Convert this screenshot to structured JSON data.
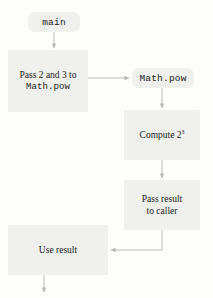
{
  "diagram": {
    "colors": {
      "node_fill": "#f0f0ee",
      "edge_stroke": "#b9b9b5",
      "text": "#1b1b1b",
      "background": "#fdfdfc"
    },
    "nodes": [
      {
        "id": "main",
        "shape": "rounded-pill",
        "label": "main",
        "font": "mono"
      },
      {
        "id": "pass-args",
        "shape": "rectangle",
        "label_line1": "Pass 2 and 3 to",
        "label_line2": "Math.pow",
        "font_line1": "serif",
        "font_line2": "mono"
      },
      {
        "id": "mathpow",
        "shape": "rounded-pill",
        "label": "Math.pow",
        "font": "mono"
      },
      {
        "id": "compute",
        "shape": "rectangle",
        "label_prefix": "Compute 2",
        "label_superscript": "3",
        "font": "serif"
      },
      {
        "id": "pass-result",
        "shape": "rectangle",
        "label_line1": "Pass result",
        "label_line2": "to caller",
        "font": "serif"
      },
      {
        "id": "use-result",
        "shape": "rectangle",
        "label": "Use result",
        "font": "serif"
      }
    ],
    "edges": [
      {
        "id": "main-to-pass-args",
        "from": "main",
        "to": "pass-args",
        "style": "straight-down"
      },
      {
        "id": "pass-args-to-mathpow",
        "from": "pass-args",
        "to": "mathpow",
        "style": "straight-right"
      },
      {
        "id": "mathpow-to-compute",
        "from": "mathpow",
        "to": "compute",
        "style": "straight-down"
      },
      {
        "id": "compute-to-pass-result",
        "from": "compute",
        "to": "pass-result",
        "style": "straight-down"
      },
      {
        "id": "pass-result-to-use",
        "from": "pass-result",
        "to": "use-result",
        "style": "elbow-down-left"
      },
      {
        "id": "use-result-to-exit",
        "from": "use-result",
        "to": "exit",
        "style": "straight-down"
      }
    ]
  }
}
